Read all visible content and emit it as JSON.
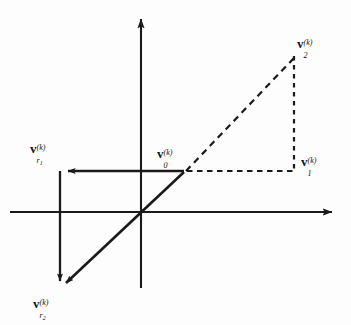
{
  "figure": {
    "background_color": "#fdfdfd",
    "stroke_color": "#1a1a1a",
    "width": 351,
    "height": 325
  },
  "axes": {
    "x_axis": {
      "name": "horizontal-axis",
      "from_x": 10,
      "to_x": 338,
      "y": 212,
      "arrow": "right"
    },
    "y_axis": {
      "name": "vertical-axis",
      "x": 141,
      "from_y": 288,
      "to_y": 13,
      "arrow": "up"
    },
    "origin": {
      "x": 141,
      "y": 212
    }
  },
  "points": {
    "origin": {
      "x": 141,
      "y": 212
    },
    "v0": {
      "x": 184,
      "y": 172
    },
    "v1": {
      "x": 295,
      "y": 172
    },
    "v2": {
      "x": 295,
      "y": 55
    },
    "vr1_tip": {
      "x": 60,
      "y": 171
    },
    "vr2_tip": {
      "x": 62,
      "y": 288
    },
    "vr1_corner": {
      "x": 60,
      "y": 171
    }
  },
  "labels": [
    {
      "id": "v-r1",
      "name": "label-v-r1",
      "base": "v",
      "sub": "r",
      "subsub": "1",
      "sup": "(k)",
      "x": 30,
      "y": 142,
      "description": "v sub r1 superscript (k)"
    },
    {
      "id": "v-r2",
      "name": "label-v-r2",
      "base": "v",
      "sub": "r",
      "subsub": "2",
      "sup": "(k)",
      "x": 33,
      "y": 297,
      "description": "v sub r2 superscript (k)"
    },
    {
      "id": "v-0",
      "name": "label-v-0",
      "base": "v",
      "sub": "0",
      "subsub": "",
      "sup": "(k)",
      "x": 157,
      "y": 147,
      "description": "v sub 0 superscript (k)"
    },
    {
      "id": "v-1",
      "name": "label-v-1",
      "base": "v",
      "sub": "1",
      "subsub": "",
      "sup": "(k)",
      "x": 301,
      "y": 155,
      "description": "v sub 1 superscript (k)"
    },
    {
      "id": "v-2",
      "name": "label-v-2",
      "base": "v",
      "sub": "2",
      "subsub": "",
      "sup": "(k)",
      "x": 297,
      "y": 37,
      "description": "v sub 2 superscript (k)"
    }
  ],
  "segments": {
    "solid_diagonal": {
      "name": "solid-diagonal-vector",
      "description": "Solid line from v0 through origin down-left to v-r2 with arrowhead",
      "style": "solid"
    },
    "solid_horizontal": {
      "name": "solid-horizontal-vector",
      "description": "Solid horizontal line from v0 leftward to v-r1 arrowhead",
      "style": "solid"
    },
    "solid_vertical": {
      "name": "solid-vertical-connector",
      "description": "Solid vertical line from v-r1 corner down to v-r2 arrowhead",
      "style": "solid"
    },
    "dashed_hypotenuse": {
      "name": "dashed-hypotenuse",
      "description": "Dashed line from v0 up-right to v2",
      "style": "dashed"
    },
    "dashed_vertical": {
      "name": "dashed-vertical-leg",
      "description": "Dashed vertical line from v2 down to v1",
      "style": "dashed"
    },
    "dashed_horizontal": {
      "name": "dashed-horizontal-leg",
      "description": "Dashed horizontal line from v0 right to v1",
      "style": "dashed"
    }
  }
}
